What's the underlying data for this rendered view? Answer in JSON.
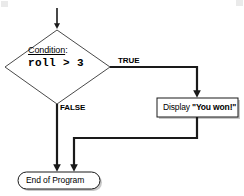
{
  "diagram": {
    "type": "flowchart",
    "background_color": "#ffffff",
    "line_color": "#1a1a1a",
    "shape_fill": "#ffffff",
    "shadow_color": "#c8c8c8",
    "nodes": {
      "start_arrow": {
        "shape": "arrow",
        "icon": "down-arrow-icon"
      },
      "decision": {
        "shape": "diamond",
        "label": "Condition",
        "label_suffix": ":",
        "expression": "roll > 3"
      },
      "display": {
        "shape": "process-rectangle",
        "text_prefix": "Display ",
        "text_quoted": "\"You won!\""
      },
      "terminal": {
        "shape": "rounded-terminator",
        "text": "End of Program"
      }
    },
    "edges": [
      {
        "from": "start",
        "to": "decision",
        "label": ""
      },
      {
        "from": "decision",
        "to": "display",
        "label": "TRUE"
      },
      {
        "from": "decision",
        "to": "terminal",
        "label": "FALSE"
      },
      {
        "from": "display",
        "to": "terminal",
        "label": ""
      }
    ],
    "edge_labels": {
      "true": "TRUE",
      "false": "FALSE"
    }
  }
}
